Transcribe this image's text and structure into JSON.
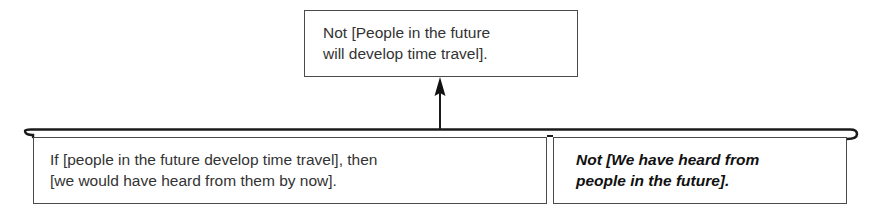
{
  "diagram": {
    "type": "argument-map",
    "conclusion": {
      "lines": [
        "Not [People in the future",
        "will develop time travel]."
      ],
      "full_text": "Not [People in the future will develop time travel]."
    },
    "premises": [
      {
        "lines": [
          "If [people in the future develop time travel], then",
          "[we would have heard from them by now]."
        ],
        "full_text": "If [people in the future develop time travel], then [we would have heard from them by now].",
        "style": "regular"
      },
      {
        "lines": [
          "Not [We have heard from",
          "people in the future]."
        ],
        "full_text": "Not [We have heard from people in the future].",
        "style": "bold-italic"
      }
    ],
    "connectors": {
      "bracket": "joins premises together (linked argument)",
      "arrow": "from joined premises up to conclusion",
      "line_color": "#1a1a1a",
      "box_border_color": "#4a4a4a"
    }
  }
}
